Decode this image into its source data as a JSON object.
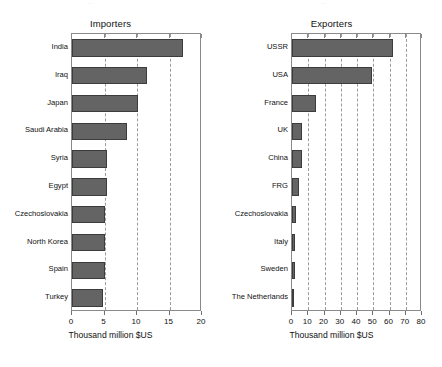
{
  "figure": {
    "background": "#ffffff",
    "bar_color": "#646464",
    "bar_edge_color": "#3c3c3c",
    "grid_color": "#9b9b9b",
    "frame_color": "#8a8a8a"
  },
  "chart_data": [
    {
      "type": "bar",
      "orientation": "horizontal",
      "title": "Importers",
      "xlabel": "Thousand million $US",
      "ylabel": "",
      "xlim": [
        0,
        20
      ],
      "xticks": [
        0,
        5,
        10,
        15,
        20
      ],
      "xticklabels": [
        "0",
        "5",
        "10",
        "15",
        "20"
      ],
      "grid": true,
      "grid_axis": "x",
      "grid_style": "dashed",
      "legend": false,
      "categories": [
        "India",
        "Iraq",
        "Japan",
        "Saudi Arabia",
        "Syria",
        "Egypt",
        "Czechoslovakia",
        "North Korea",
        "Spain",
        "Turkey"
      ],
      "values": [
        17.1,
        11.5,
        10.1,
        8.5,
        5.4,
        5.4,
        5.1,
        5.0,
        5.0,
        4.7
      ]
    },
    {
      "type": "bar",
      "orientation": "horizontal",
      "title": "Exporters",
      "xlabel": "Thousand million $US",
      "ylabel": "",
      "xlim": [
        0,
        80
      ],
      "xticks": [
        0,
        10,
        20,
        30,
        40,
        50,
        60,
        70,
        80
      ],
      "xticklabels": [
        "0",
        "10",
        "20",
        "30",
        "40",
        "50",
        "60",
        "70",
        "80"
      ],
      "grid": true,
      "grid_axis": "x",
      "grid_style": "dashed",
      "legend": false,
      "categories": [
        "USSR",
        "USA",
        "France",
        "UK",
        "China",
        "FRG",
        "Czechoslovakia",
        "Italy",
        "Sweden",
        "The Netherlands"
      ],
      "values": [
        62.0,
        49.0,
        14.5,
        6.0,
        6.0,
        4.4,
        2.3,
        1.8,
        1.8,
        1.4
      ]
    }
  ]
}
